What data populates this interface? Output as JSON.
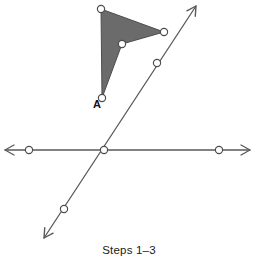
{
  "figure": {
    "caption": "Steps 1–3",
    "background_color": "#ffffff",
    "line_color": "#595959",
    "shape_fill_color": "#6b6b6b",
    "shape_stroke_color": "#4d4d4d",
    "node_fill_color": "#ffffff",
    "node_stroke_color": "#4d4d4d",
    "width": 258,
    "height": 266
  },
  "chart_data": {
    "type": "diagram",
    "title": "Steps 1–3",
    "grid": false,
    "legend": null,
    "xlabel": "",
    "ylabel": "",
    "xlim": [
      0,
      258
    ],
    "ylim": [
      0,
      266
    ],
    "shapes": [
      {
        "name": "dart-polygon",
        "kind": "polygon",
        "filled": true,
        "vertices": [
          {
            "label": "",
            "x": 101,
            "y": 9
          },
          {
            "label": "",
            "x": 164,
            "y": 32
          },
          {
            "label": "",
            "x": 122,
            "y": 44
          },
          {
            "label": "A",
            "x": 102,
            "y": 98
          }
        ]
      }
    ],
    "lines": [
      {
        "name": "horizontal-line",
        "kind": "double-arrow-line",
        "x1": 5,
        "y1": 150,
        "x2": 250,
        "y2": 150,
        "arrow_start": true,
        "arrow_end": true
      },
      {
        "name": "diagonal-line",
        "kind": "double-arrow-line",
        "x1": 44,
        "y1": 238,
        "x2": 196,
        "y2": 6,
        "arrow_start": true,
        "arrow_end": true
      }
    ],
    "points": [
      {
        "name": "horizontal-left-point",
        "x": 29,
        "y": 150,
        "label": ""
      },
      {
        "name": "intersection-point",
        "x": 104,
        "y": 150,
        "label": ""
      },
      {
        "name": "horizontal-right-point",
        "x": 219,
        "y": 150,
        "label": ""
      },
      {
        "name": "diagonal-lower-point",
        "x": 64,
        "y": 209,
        "label": ""
      },
      {
        "name": "diagonal-upper-point",
        "x": 157,
        "y": 63,
        "label": ""
      },
      {
        "name": "polygon-vertex-top",
        "x": 101,
        "y": 9,
        "label": ""
      },
      {
        "name": "polygon-vertex-right",
        "x": 164,
        "y": 32,
        "label": ""
      },
      {
        "name": "polygon-vertex-inner",
        "x": 122,
        "y": 44,
        "label": ""
      },
      {
        "name": "polygon-vertex-a",
        "x": 102,
        "y": 98,
        "label": "A"
      }
    ],
    "annotations": [
      {
        "name": "vertex-label-a",
        "text": "A",
        "x": 93,
        "y": 108
      }
    ]
  }
}
